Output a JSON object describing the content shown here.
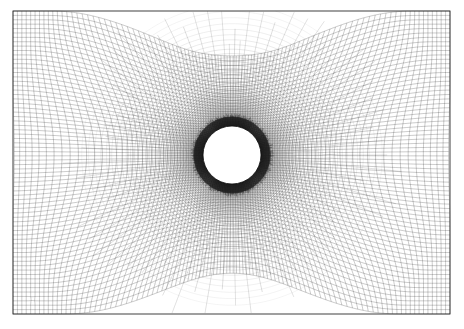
{
  "figure": {
    "type": "computational-mesh",
    "caption": "",
    "width_px": 464,
    "height_px": 329
  },
  "colors": {
    "background": "#ffffff",
    "mesh_line": "#1a1a1a",
    "frame": "#2a2a2a",
    "cylinder_fill": "#ffffff",
    "cylinder_stroke": "#000000"
  },
  "domain": {
    "name": "rectangular-far-field",
    "x0": 13,
    "y0": 11,
    "x1": 450,
    "y1": 314,
    "width": 437,
    "height": 303,
    "frame_stroke_width": 0.9
  },
  "cylinder": {
    "name": "circular-hole",
    "center_x": 232,
    "center_y": 155,
    "radius": 29,
    "label": ""
  },
  "mesh_params": {
    "base_cell_px": 4.4,
    "near_wall_cell_px": 0.9,
    "radial_layers": 150,
    "circumferential_divisions": 260,
    "boundary_layer_growth": 1.055,
    "boundary_layer_outer_radius": 150,
    "line_width_far": 0.26,
    "line_width_near": 0.2,
    "blend_start_radius": 150,
    "blend_end_radius": 235
  },
  "refinement_spots": [
    {
      "name": "spot-upper-left",
      "x": 133,
      "y": 95,
      "radius": 16,
      "strength": 0.55
    },
    {
      "name": "spot-upper-left-2",
      "x": 107,
      "y": 128,
      "radius": 13,
      "strength": 0.42
    },
    {
      "name": "spot-upper-mid",
      "x": 171,
      "y": 70,
      "radius": 14,
      "strength": 0.45
    },
    {
      "name": "spot-upper-right",
      "x": 285,
      "y": 72,
      "radius": 13,
      "strength": 0.4
    },
    {
      "name": "spot-right",
      "x": 330,
      "y": 150,
      "radius": 15,
      "strength": 0.45
    },
    {
      "name": "spot-lower-right",
      "x": 300,
      "y": 225,
      "radius": 14,
      "strength": 0.44
    },
    {
      "name": "spot-lower-mid",
      "x": 212,
      "y": 248,
      "radius": 13,
      "strength": 0.42
    },
    {
      "name": "spot-lower-left",
      "x": 150,
      "y": 215,
      "radius": 13,
      "strength": 0.4
    },
    {
      "name": "spot-left",
      "x": 96,
      "y": 185,
      "radius": 12,
      "strength": 0.35
    },
    {
      "name": "spot-bottom-left-mark",
      "x": 32,
      "y": 300,
      "radius": 6,
      "strength": 0.85
    }
  ],
  "chart_data": {
    "type": "mesh",
    "xlabel": "",
    "ylabel": "",
    "xlim": [
      13,
      450
    ],
    "ylim": [
      11,
      314
    ],
    "grid": true,
    "legend": false,
    "annotations": [],
    "geometry": {
      "outer_boundary": "rectangle",
      "inner_boundary": "circle",
      "circle_center": [
        232,
        155
      ],
      "circle_radius": 29
    }
  }
}
